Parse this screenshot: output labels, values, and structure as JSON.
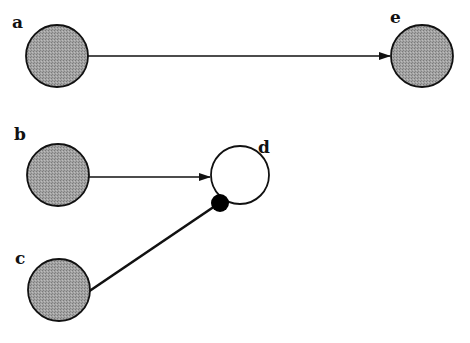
{
  "diagram": {
    "type": "network",
    "nodes": [
      {
        "id": "a",
        "label": "a",
        "cx": 57,
        "cy": 56,
        "r": 31,
        "style": "shaded",
        "label_x": 12,
        "label_y": 28
      },
      {
        "id": "e",
        "label": "e",
        "cx": 422,
        "cy": 56,
        "r": 31,
        "style": "shaded",
        "label_x": 390,
        "label_y": 23
      },
      {
        "id": "b",
        "label": "b",
        "cx": 58,
        "cy": 175,
        "r": 31,
        "style": "shaded",
        "label_x": 14,
        "label_y": 140
      },
      {
        "id": "d",
        "label": "d",
        "cx": 240,
        "cy": 175,
        "r": 29,
        "style": "open",
        "label_x": 258,
        "label_y": 153
      },
      {
        "id": "c",
        "label": "c",
        "cx": 59,
        "cy": 290,
        "r": 31,
        "style": "shaded",
        "label_x": 15,
        "label_y": 264
      }
    ],
    "edges": [
      {
        "from": "a",
        "to": "e",
        "type": "arrow"
      },
      {
        "from": "b",
        "to": "d",
        "type": "arrow"
      },
      {
        "from": "c",
        "to": "d",
        "type": "inhibit-dot"
      }
    ],
    "colors": {
      "node_fill": "#9a9a9a",
      "node_stroke": "#111111",
      "open_fill": "#ffffff",
      "edge": "#111111",
      "dot": "#000000"
    }
  }
}
